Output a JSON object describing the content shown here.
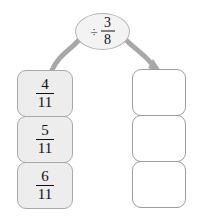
{
  "diagram": {
    "kind": "fraction-division-mapping",
    "background_color": "#ffffff",
    "operator": {
      "symbol": "÷",
      "symbol_name": "division-sign",
      "fraction": {
        "numerator": "3",
        "denominator": "8"
      },
      "text": "÷ 3/8",
      "fill_color": "#f3f3f3",
      "border_color": "#b4b4b4"
    },
    "arrows": {
      "left": {
        "name": "input-arrow",
        "description": "curve from operator bubble down-left to input column",
        "color": "#a8a8a8",
        "has_head": false
      },
      "right": {
        "name": "output-arrow",
        "description": "curve from operator bubble down-right into output column",
        "color": "#a8a8a8",
        "has_head": true
      }
    },
    "input_column": {
      "name": "input-values",
      "fill_color": "#ededed",
      "border_color": "#a9a9a9",
      "cards": [
        {
          "numerator": "4",
          "denominator": "11",
          "text": "4/11"
        },
        {
          "numerator": "5",
          "denominator": "11",
          "text": "5/11"
        },
        {
          "numerator": "6",
          "denominator": "11",
          "text": "6/11"
        }
      ]
    },
    "output_column": {
      "name": "output-values",
      "fill_color": "#ffffff",
      "border_color": "#9d9d9d",
      "cards": [
        {
          "text": ""
        },
        {
          "text": ""
        },
        {
          "text": ""
        }
      ]
    }
  }
}
